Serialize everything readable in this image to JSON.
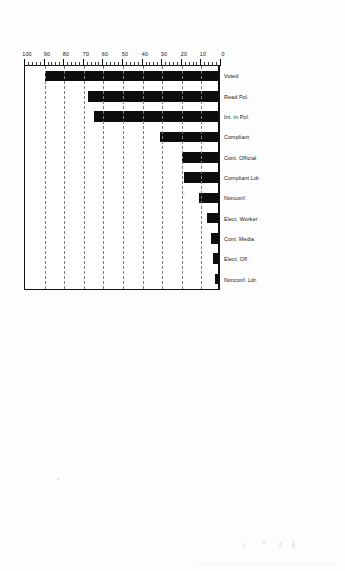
{
  "document": {
    "kind": "scanned-figure-page",
    "orientation_note": "two bar charts printed sideways on a scanned page",
    "charts_count": 2
  },
  "chart_data": [
    {
      "id": "chart-top",
      "type": "bar",
      "title": "",
      "xlabel": "",
      "ylabel": "",
      "ylim": [
        0,
        100
      ],
      "ytick_step": 10,
      "grid": true,
      "legend": "none",
      "rotation_deg": -90,
      "ytick_labels": [
        "0",
        "10",
        "20",
        "30",
        "40",
        "50",
        "60",
        "70",
        "80",
        "90",
        "100"
      ],
      "categories": [
        "Nonconf. Ldr.",
        "Elect. Off.",
        "Cont. Media",
        "Elect. Worker",
        "Nonconf.",
        "Compliant Ldr.",
        "Cont. Official",
        "Compliant",
        "Int. in Pol.",
        "Read Pol.",
        "Voted"
      ],
      "values": [
        2,
        3,
        4,
        6,
        10,
        18,
        19,
        30,
        64,
        67,
        89
      ]
    },
    {
      "id": "chart-bottom",
      "type": "bar",
      "title": "",
      "xlabel": "",
      "ylabel": "",
      "ylim": [
        0,
        100
      ],
      "ytick_step": 10,
      "grid": true,
      "legend": "none",
      "rotation_deg": -90,
      "ytick_labels": [
        "0",
        "10",
        "20",
        "30",
        "40",
        "50",
        "60",
        "70",
        "80",
        "90",
        "100"
      ],
      "categories": [
        "Pers. Violence",
        "Damage Property",
        "Boycott",
        "Lawful Demo.",
        "Ch. Action Gp.",
        "Party Work",
        "Cont. Official",
        "Group Work",
        "Attend Mtg.",
        "Petition",
        "Discuss Pol.",
        "Int. in Pol.",
        "Read Pol.",
        "State Vote",
        "Federal Vote"
      ],
      "values": [
        1,
        1,
        1,
        6,
        7,
        8,
        8,
        9,
        16,
        19,
        43,
        66,
        74,
        80,
        90
      ]
    }
  ]
}
